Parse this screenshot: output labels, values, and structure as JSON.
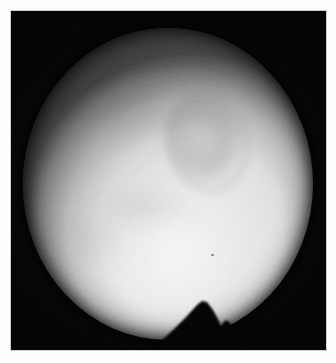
{
  "image": {
    "kind": "grayscale-planetary-disk-photograph",
    "caption": "",
    "frame": {
      "border_color": "#fdfdfd",
      "border_width_px": 11,
      "plate_color": "#050505"
    },
    "canvas": {
      "width_px": 336,
      "height_px": 363,
      "field_left_px": 11,
      "field_top_px": 11,
      "field_width_px": 315,
      "field_height_px": 339
    },
    "disk": {
      "label": "planetary disk",
      "center_x_px": 168,
      "center_y_px": 184,
      "radius_x_px": 145,
      "radius_y_px": 156,
      "brightest_color": "#f2f2f2",
      "limb_color": "#a8a8a8",
      "limb_darkening_direction": "upper-left"
    },
    "features": [
      {
        "name": "dark-oval-albedo-feature",
        "center_x_px": 202,
        "center_y_px": 143,
        "width_px": 78,
        "height_px": 96,
        "tone": "#6e6e6e"
      },
      {
        "name": "northwest-dusky-patch",
        "center_x_px": 128,
        "center_y_px": 111,
        "width_px": 118,
        "height_px": 84,
        "tone": "#5a5a5a"
      },
      {
        "name": "mid-left-mottling-band",
        "center_x_px": 138,
        "center_y_px": 212,
        "width_px": 110,
        "height_px": 54,
        "tone": "#5f5f5f"
      },
      {
        "name": "southwest-smudge",
        "center_x_px": 89,
        "center_y_px": 239,
        "width_px": 76,
        "height_px": 64,
        "tone": "#505050"
      },
      {
        "name": "bright-southern-zone",
        "center_x_px": 175,
        "center_y_px": 263,
        "width_px": 136,
        "height_px": 112,
        "tone": "#ffffff"
      },
      {
        "name": "plate-speck",
        "center_x_px": 212,
        "center_y_px": 255,
        "width_px": 3,
        "height_px": 2,
        "tone": "#282828"
      }
    ],
    "notch": {
      "name": "bottom-wedge-occultation",
      "description": "black triangular wedge intruding upward into the disk from the bottom edge",
      "apex_x_px": 200,
      "apex_y_px": 300,
      "base_left_x_px": 158,
      "base_right_x_px": 232,
      "base_y_px": 350,
      "secondary_notch_x_px": 222,
      "secondary_notch_y_px": 323,
      "color": "#050505"
    },
    "grain": {
      "name": "film-grain",
      "opacity": 0.3,
      "coarse_opacity": 0.22
    }
  }
}
